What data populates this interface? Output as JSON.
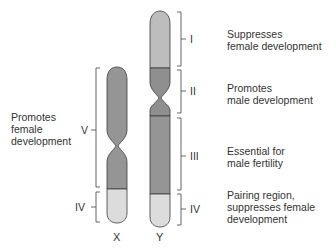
{
  "diagram": {
    "title": "",
    "colors": {
      "background": "#ffffff",
      "light_gray": "#bcbcbc",
      "dark_gray": "#939393",
      "pairing_region": "#dcdcdc",
      "outline": "#3a3a3a",
      "bracket": "#555555",
      "text": "#333333"
    },
    "chromosomes": [
      {
        "name": "X",
        "label": "X"
      },
      {
        "name": "Y",
        "label": "Y"
      }
    ],
    "regions": {
      "I": {
        "numeral": "I",
        "chromosome": "Y",
        "line1": "Suppresses",
        "line2": "female development"
      },
      "II": {
        "numeral": "II",
        "chromosome": "Y",
        "line1": "Promotes",
        "line2": "male development"
      },
      "III": {
        "numeral": "III",
        "chromosome": "Y",
        "line1": "Essential for",
        "line2": "male fertility"
      },
      "IV_Y": {
        "numeral": "IV",
        "chromosome": "Y",
        "line1": "Pairing region,",
        "line2": "suppresses female",
        "line3": "development"
      },
      "V": {
        "numeral": "V",
        "chromosome": "X",
        "line1": "Promotes",
        "line2": "female",
        "line3": "development"
      },
      "IV_X": {
        "numeral": "IV",
        "chromosome": "X"
      }
    }
  }
}
